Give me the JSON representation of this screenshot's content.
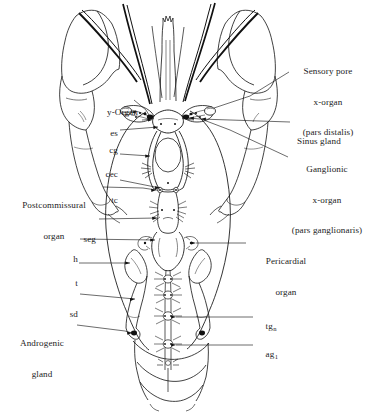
{
  "figure": {
    "view": "dorsal",
    "background_color": "#ffffff",
    "line_color": "#111111"
  },
  "labels": {
    "right": [
      {
        "id": "sensory-pore-x-organ",
        "lines": [
          "Sensory pore",
          "x-organ",
          "(pars distalis)"
        ],
        "align": "center"
      },
      {
        "id": "sinus-gland",
        "lines": [
          "Sinus gland"
        ],
        "align": "left"
      },
      {
        "id": "ganglionic-x-organ",
        "lines": [
          "Ganglionic",
          "x-organ",
          "(pars ganglionaris)"
        ],
        "align": "center"
      },
      {
        "id": "pericardial-organ",
        "lines": [
          "Pericardial",
          "organ"
        ],
        "align": "center"
      },
      {
        "id": "tg-n",
        "lines": [
          "tg"
        ],
        "subscript": "n",
        "align": "left"
      },
      {
        "id": "ag-1",
        "lines": [
          "ag"
        ],
        "subscript": "1",
        "align": "left"
      }
    ],
    "left": [
      {
        "id": "y-organ",
        "lines": [
          "y-Organ"
        ],
        "align": "left"
      },
      {
        "id": "es",
        "lines": [
          "es"
        ],
        "align": "right"
      },
      {
        "id": "cg",
        "lines": [
          "cg"
        ],
        "align": "right"
      },
      {
        "id": "cec",
        "lines": [
          "cec"
        ],
        "align": "right"
      },
      {
        "id": "tc",
        "lines": [
          "tc"
        ],
        "align": "right"
      },
      {
        "id": "postcommissural-organ",
        "lines": [
          "Postcommissural",
          "organ"
        ],
        "align": "center"
      },
      {
        "id": "seg",
        "lines": [
          "seg"
        ],
        "align": "right"
      },
      {
        "id": "h",
        "lines": [
          "h"
        ],
        "align": "right"
      },
      {
        "id": "t",
        "lines": [
          "t"
        ],
        "align": "right"
      },
      {
        "id": "sd",
        "lines": [
          "sd"
        ],
        "align": "right"
      },
      {
        "id": "androgenic-gland",
        "lines": [
          "Androgenic",
          "gland"
        ],
        "align": "center"
      }
    ]
  }
}
